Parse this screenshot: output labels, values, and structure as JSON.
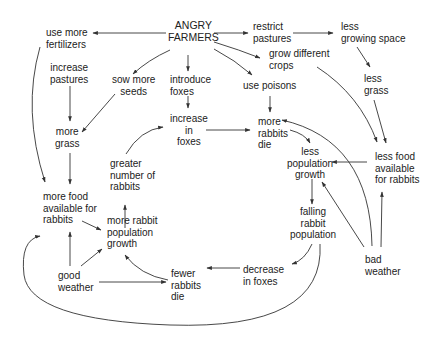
{
  "nodes": {
    "angry_farmers": [
      "ANGRY",
      "FARMERS"
    ],
    "use_more_fertilizers": [
      "use more",
      "fertilizers"
    ],
    "restrict_pastures": [
      "restrict",
      "pastures"
    ],
    "less_growing_space": [
      "less",
      "growing space"
    ],
    "increase_pastures": [
      "increase",
      "pastures"
    ],
    "sow_more_seeds": [
      "sow more",
      "seeds"
    ],
    "introduce_foxes": [
      "introduce",
      "foxes"
    ],
    "grow_different_crops": [
      "grow different",
      "crops"
    ],
    "use_poisons": [
      "use poisons"
    ],
    "less_grass": [
      "less",
      "grass"
    ],
    "more_grass": [
      "more",
      "grass"
    ],
    "increase_in_foxes": [
      "increase",
      "in",
      "foxes"
    ],
    "more_rabbits_die": [
      "more",
      "rabbits",
      "die"
    ],
    "less_population_growth": [
      "less",
      "population",
      "growth"
    ],
    "less_food_available": [
      "less food",
      "available",
      "for rabbits"
    ],
    "greater_number_of_rabbits": [
      "greater",
      "number of",
      "rabbits"
    ],
    "more_food_available": [
      "more food",
      "available for",
      "rabbits"
    ],
    "more_rabbit_population_growth": [
      "more rabbit",
      "population",
      "growth"
    ],
    "falling_rabbit_population": [
      "falling",
      "rabbit",
      "population"
    ],
    "good_weather": [
      "good",
      "weather"
    ],
    "fewer_rabbits_die": [
      "fewer",
      "rabbits",
      "die"
    ],
    "decrease_in_foxes": [
      "decrease",
      "in foxes"
    ],
    "bad_weather": [
      "bad",
      "weather"
    ]
  },
  "edges": [
    {
      "from": "angry_farmers",
      "to": "use_more_fertilizers"
    },
    {
      "from": "angry_farmers",
      "to": "restrict_pastures"
    },
    {
      "from": "angry_farmers",
      "to": "sow_more_seeds"
    },
    {
      "from": "angry_farmers",
      "to": "introduce_foxes"
    },
    {
      "from": "angry_farmers",
      "to": "grow_different_crops"
    },
    {
      "from": "angry_farmers",
      "to": "use_poisons"
    },
    {
      "from": "restrict_pastures",
      "to": "less_growing_space"
    },
    {
      "from": "less_growing_space",
      "to": "less_grass"
    },
    {
      "from": "less_grass",
      "to": "less_food_available"
    },
    {
      "from": "grow_different_crops",
      "to": "less_food_available"
    },
    {
      "from": "increase_pastures",
      "to": "more_grass"
    },
    {
      "from": "sow_more_seeds",
      "to": "more_grass"
    },
    {
      "from": "use_more_fertilizers",
      "to": "more_food_available"
    },
    {
      "from": "more_grass",
      "to": "more_food_available"
    },
    {
      "from": "introduce_foxes",
      "to": "increase_in_foxes"
    },
    {
      "from": "use_poisons",
      "to": "more_rabbits_die"
    },
    {
      "from": "increase_in_foxes",
      "to": "more_rabbits_die"
    },
    {
      "from": "greater_number_of_rabbits",
      "to": "increase_in_foxes"
    },
    {
      "from": "more_rabbits_die",
      "to": "less_population_growth"
    },
    {
      "from": "less_food_available",
      "to": "less_population_growth"
    },
    {
      "from": "less_population_growth",
      "to": "falling_rabbit_population"
    },
    {
      "from": "falling_rabbit_population",
      "to": "decrease_in_foxes"
    },
    {
      "from": "falling_rabbit_population",
      "to": "more_food_available"
    },
    {
      "from": "decrease_in_foxes",
      "to": "fewer_rabbits_die"
    },
    {
      "from": "fewer_rabbits_die",
      "to": "more_rabbit_population_growth"
    },
    {
      "from": "more_rabbit_population_growth",
      "to": "greater_number_of_rabbits"
    },
    {
      "from": "more_food_available",
      "to": "more_rabbit_population_growth"
    },
    {
      "from": "good_weather",
      "to": "more_food_available"
    },
    {
      "from": "good_weather",
      "to": "more_rabbit_population_growth"
    },
    {
      "from": "good_weather",
      "to": "fewer_rabbits_die"
    },
    {
      "from": "bad_weather",
      "to": "less_food_available"
    },
    {
      "from": "bad_weather",
      "to": "less_population_growth"
    },
    {
      "from": "bad_weather",
      "to": "more_rabbits_die"
    }
  ],
  "colors": {
    "line": "#333333",
    "text": "#222222",
    "background": "#ffffff"
  }
}
